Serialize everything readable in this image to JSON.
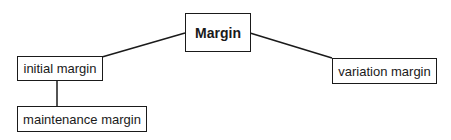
{
  "diagram": {
    "type": "tree",
    "nodes": [
      {
        "id": "margin",
        "label": "Margin"
      },
      {
        "id": "initial",
        "label": "initial margin"
      },
      {
        "id": "maintenance",
        "label": "maintenance margin"
      },
      {
        "id": "variation",
        "label": "variation margin"
      }
    ],
    "edges": [
      {
        "from": "margin",
        "to": "initial"
      },
      {
        "from": "margin",
        "to": "variation"
      },
      {
        "from": "initial",
        "to": "maintenance"
      }
    ]
  }
}
